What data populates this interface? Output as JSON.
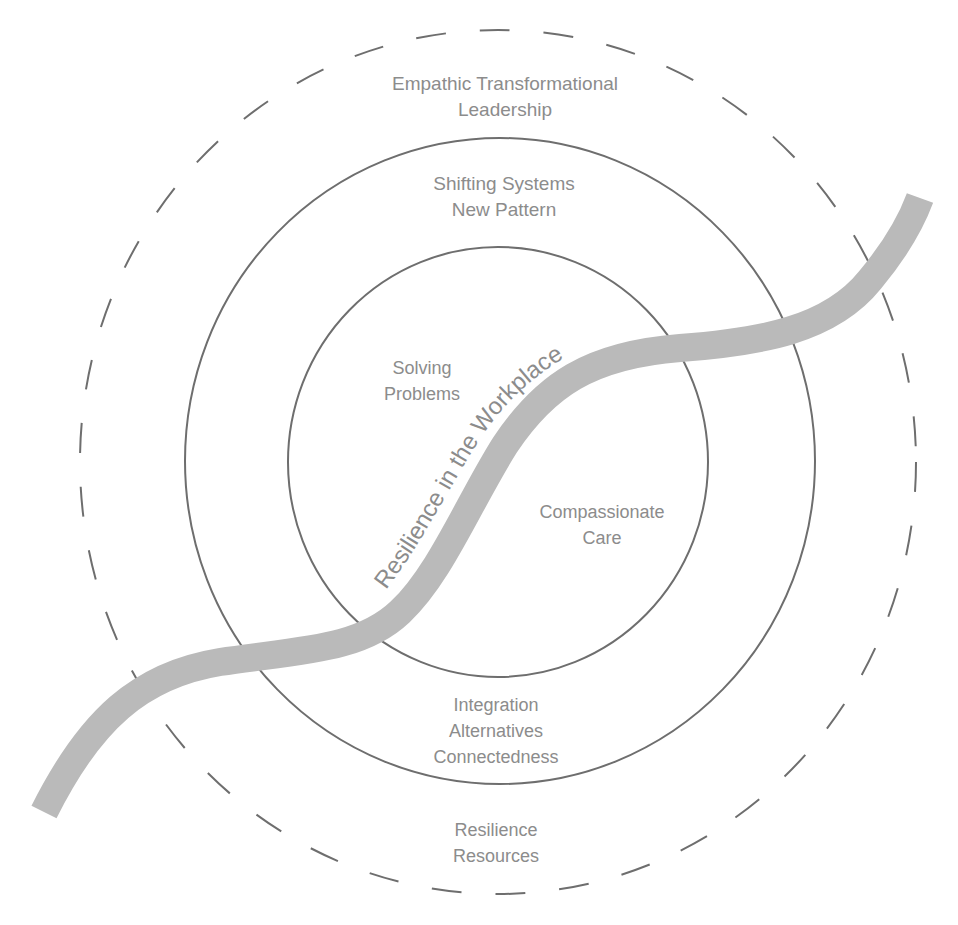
{
  "diagram": {
    "colors": {
      "background": "#ffffff",
      "lines": "#6e6e6e",
      "ribbon": "#bababa",
      "text": "#8c8c8c"
    },
    "rings": [
      {
        "name": "outer",
        "style": "dashed",
        "cx": 498,
        "cy": 462,
        "rx": 418,
        "ry": 432
      },
      {
        "name": "middle",
        "style": "solid",
        "cx": 500,
        "cy": 461,
        "rx": 315,
        "ry": 323
      },
      {
        "name": "inner",
        "style": "solid",
        "cx": 498,
        "cy": 462,
        "rx": 210,
        "ry": 215
      }
    ],
    "ribbon_label": "Resilience in the Workplace",
    "labels": {
      "outer_top": [
        "Empathic Transformational",
        "Leadership"
      ],
      "middle_top": [
        "Shifting Systems",
        "New Pattern"
      ],
      "inner_left": [
        "Solving",
        "Problems"
      ],
      "inner_right": [
        "Compassionate",
        "Care"
      ],
      "middle_bottom": [
        "Integration",
        "Alternatives",
        "Connectedness"
      ],
      "outer_bottom": [
        "Resilience",
        "Resources"
      ]
    }
  }
}
